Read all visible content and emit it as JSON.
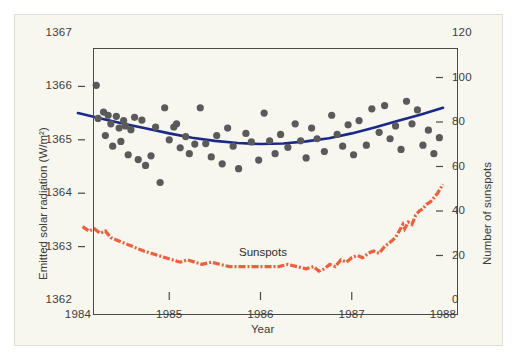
{
  "chart_data": {
    "type": "scatter",
    "title": "",
    "xlabel": "Year",
    "ylabel": "Emitted solar radiation (W/m2)",
    "ylabel_right": "Number of sunspots",
    "xlim": [
      1984,
      1988
    ],
    "ylim": [
      1362,
      1367
    ],
    "ylim_right": [
      0,
      120
    ],
    "xticks": [
      "1984",
      "1985",
      "1986",
      "1987",
      "1988"
    ],
    "yticks_left": [
      "1362",
      "1363",
      "1364",
      "1365",
      "1366",
      "1367"
    ],
    "yticks_right": [
      "0",
      "20",
      "40",
      "60",
      "80",
      "100",
      "120"
    ],
    "grid": false,
    "legend": "none",
    "annotations": [
      {
        "text": "Sunspots",
        "x": 1985.45,
        "y_right": 26
      }
    ],
    "series": [
      {
        "name": "Emitted solar radiation",
        "type": "scatter",
        "axis": "left",
        "color": "#5a5a5a",
        "marker": "filled-circle",
        "points": [
          [
            1984.2,
            1366.02
          ],
          [
            1984.22,
            1365.4
          ],
          [
            1984.28,
            1365.52
          ],
          [
            1984.3,
            1365.08
          ],
          [
            1984.33,
            1365.46
          ],
          [
            1984.36,
            1365.3
          ],
          [
            1984.38,
            1364.88
          ],
          [
            1984.42,
            1365.44
          ],
          [
            1984.45,
            1365.22
          ],
          [
            1984.47,
            1364.97
          ],
          [
            1984.5,
            1365.36
          ],
          [
            1984.52,
            1365.26
          ],
          [
            1984.55,
            1364.72
          ],
          [
            1984.58,
            1365.19
          ],
          [
            1984.62,
            1365.42
          ],
          [
            1984.66,
            1364.63
          ],
          [
            1984.7,
            1365.37
          ],
          [
            1984.74,
            1364.52
          ],
          [
            1984.8,
            1364.7
          ],
          [
            1984.85,
            1365.24
          ],
          [
            1984.9,
            1364.2
          ],
          [
            1984.95,
            1365.6
          ],
          [
            1985.0,
            1365.0
          ],
          [
            1985.05,
            1365.24
          ],
          [
            1985.08,
            1365.3
          ],
          [
            1985.12,
            1364.85
          ],
          [
            1985.18,
            1365.06
          ],
          [
            1985.22,
            1364.74
          ],
          [
            1985.28,
            1364.92
          ],
          [
            1985.34,
            1365.6
          ],
          [
            1985.4,
            1364.93
          ],
          [
            1985.46,
            1364.68
          ],
          [
            1985.52,
            1365.08
          ],
          [
            1985.58,
            1364.55
          ],
          [
            1985.64,
            1365.22
          ],
          [
            1985.7,
            1364.88
          ],
          [
            1985.76,
            1364.46
          ],
          [
            1985.84,
            1365.12
          ],
          [
            1985.9,
            1364.96
          ],
          [
            1985.98,
            1364.62
          ],
          [
            1986.04,
            1365.5
          ],
          [
            1986.1,
            1364.98
          ],
          [
            1986.16,
            1364.74
          ],
          [
            1986.22,
            1365.1
          ],
          [
            1986.3,
            1364.86
          ],
          [
            1986.38,
            1365.3
          ],
          [
            1986.44,
            1364.98
          ],
          [
            1986.5,
            1364.66
          ],
          [
            1986.56,
            1365.22
          ],
          [
            1986.62,
            1365.02
          ],
          [
            1986.7,
            1364.78
          ],
          [
            1986.78,
            1365.46
          ],
          [
            1986.84,
            1365.1
          ],
          [
            1986.9,
            1364.88
          ],
          [
            1986.96,
            1365.28
          ],
          [
            1987.02,
            1364.72
          ],
          [
            1987.08,
            1365.36
          ],
          [
            1987.16,
            1364.9
          ],
          [
            1987.22,
            1365.58
          ],
          [
            1987.3,
            1365.14
          ],
          [
            1987.36,
            1365.64
          ],
          [
            1987.42,
            1365.02
          ],
          [
            1987.48,
            1365.26
          ],
          [
            1987.54,
            1364.82
          ],
          [
            1987.6,
            1365.72
          ],
          [
            1987.66,
            1365.3
          ],
          [
            1987.72,
            1365.56
          ],
          [
            1987.78,
            1364.9
          ],
          [
            1987.84,
            1365.18
          ],
          [
            1987.9,
            1364.74
          ],
          [
            1987.96,
            1365.04
          ]
        ]
      },
      {
        "name": "Solar radiation trend",
        "type": "line",
        "axis": "left",
        "color": "#1a2a8a",
        "style": "solid",
        "points": [
          [
            1984.0,
            1365.5
          ],
          [
            1984.25,
            1365.4
          ],
          [
            1984.5,
            1365.3
          ],
          [
            1984.75,
            1365.21
          ],
          [
            1985.0,
            1365.12
          ],
          [
            1985.25,
            1365.04
          ],
          [
            1985.5,
            1364.98
          ],
          [
            1985.75,
            1364.94
          ],
          [
            1986.0,
            1364.92
          ],
          [
            1986.25,
            1364.93
          ],
          [
            1986.5,
            1364.97
          ],
          [
            1986.75,
            1365.03
          ],
          [
            1987.0,
            1365.12
          ],
          [
            1987.25,
            1365.23
          ],
          [
            1987.5,
            1365.35
          ],
          [
            1987.75,
            1365.47
          ],
          [
            1988.0,
            1365.6
          ]
        ]
      },
      {
        "name": "Sunspots",
        "type": "line",
        "axis": "right",
        "color": "#ef5f3c",
        "style": "dash-dot",
        "points": [
          [
            1984.05,
            33
          ],
          [
            1984.12,
            31
          ],
          [
            1984.18,
            32
          ],
          [
            1984.24,
            30
          ],
          [
            1984.3,
            31
          ],
          [
            1984.36,
            28
          ],
          [
            1984.42,
            27
          ],
          [
            1984.48,
            26
          ],
          [
            1984.54,
            25
          ],
          [
            1984.6,
            24
          ],
          [
            1984.66,
            23
          ],
          [
            1984.72,
            22
          ],
          [
            1984.8,
            21
          ],
          [
            1984.88,
            20
          ],
          [
            1984.96,
            19
          ],
          [
            1985.04,
            18
          ],
          [
            1985.12,
            17
          ],
          [
            1985.2,
            18
          ],
          [
            1985.28,
            17
          ],
          [
            1985.36,
            16
          ],
          [
            1985.46,
            17
          ],
          [
            1985.56,
            16
          ],
          [
            1985.66,
            15
          ],
          [
            1985.78,
            15
          ],
          [
            1985.9,
            15
          ],
          [
            1986.0,
            15
          ],
          [
            1986.1,
            15
          ],
          [
            1986.2,
            15
          ],
          [
            1986.3,
            16
          ],
          [
            1986.4,
            15
          ],
          [
            1986.5,
            14
          ],
          [
            1986.58,
            15
          ],
          [
            1986.64,
            13
          ],
          [
            1986.7,
            14
          ],
          [
            1986.76,
            16
          ],
          [
            1986.82,
            15
          ],
          [
            1986.88,
            18
          ],
          [
            1986.94,
            17
          ],
          [
            1987.0,
            19
          ],
          [
            1987.06,
            20
          ],
          [
            1987.12,
            19
          ],
          [
            1987.18,
            21
          ],
          [
            1987.24,
            22
          ],
          [
            1987.3,
            21
          ],
          [
            1987.36,
            24
          ],
          [
            1987.42,
            26
          ],
          [
            1987.48,
            28
          ],
          [
            1987.52,
            31
          ],
          [
            1987.56,
            34
          ],
          [
            1987.58,
            32
          ],
          [
            1987.62,
            35
          ],
          [
            1987.66,
            34
          ],
          [
            1987.7,
            38
          ],
          [
            1987.74,
            40
          ],
          [
            1987.78,
            41
          ],
          [
            1987.82,
            43
          ],
          [
            1987.86,
            44
          ],
          [
            1987.9,
            46
          ],
          [
            1987.94,
            48
          ],
          [
            1987.97,
            50
          ],
          [
            1988.0,
            52
          ]
        ]
      }
    ]
  },
  "axes": {
    "left_title": "Emitted solar radiation (W/m²)",
    "right_title": "Number of sunspots",
    "x_title": "Year"
  },
  "annotation_sunspots": "Sunspots",
  "colors": {
    "background": "#f7f6ef",
    "frame": "#4a4a48",
    "scatter": "#5a5a5a",
    "trend": "#1a2a8a",
    "sunspots": "#ef5f3c",
    "text": "#3d3d3b"
  }
}
